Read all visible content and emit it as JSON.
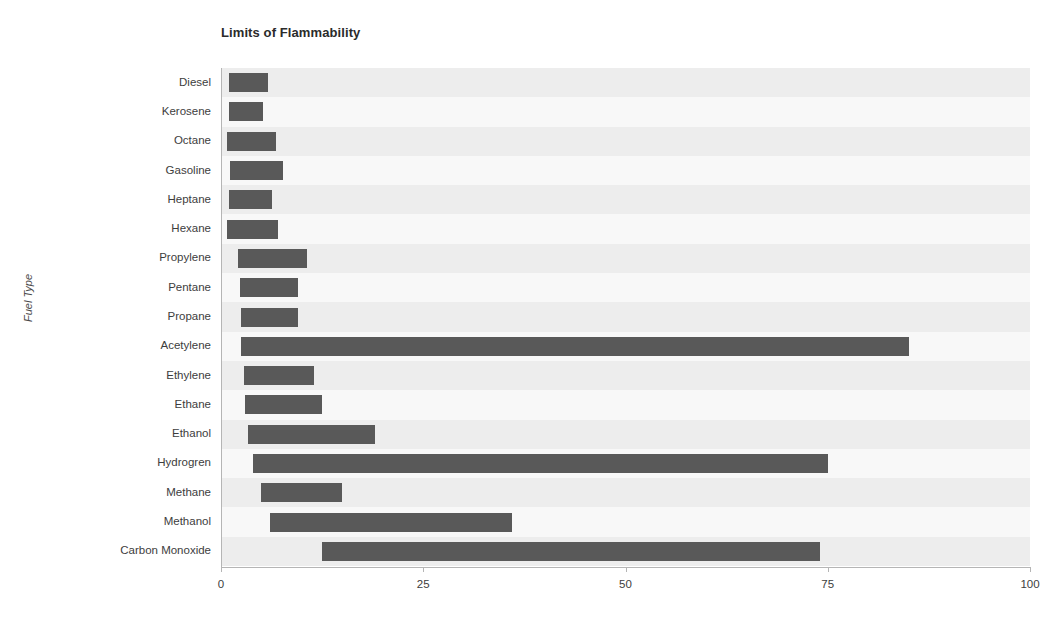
{
  "chart_data": {
    "type": "bar",
    "orientation": "horizontal",
    "subtype": "range-bar",
    "title": "Limits of Flammability",
    "xlabel": "",
    "ylabel": "Fuel Type",
    "xlim": [
      0,
      100
    ],
    "xticks": [
      0,
      25,
      50,
      75,
      100
    ],
    "xtick_labels": [
      "0",
      "25",
      "50",
      "75",
      "100"
    ],
    "grid": false,
    "legend": "none",
    "bar_color": "#595959",
    "band_color": "#ededed",
    "background": "#ffffff",
    "categories": [
      "Diesel",
      "Kerosene",
      "Octane",
      "Gasoline",
      "Heptane",
      "Hexane",
      "Propylene",
      "Pentane",
      "Propane",
      "Acetylene",
      "Ethylene",
      "Ethane",
      "Ethanol",
      "Hydrogren",
      "Methane",
      "Methanol",
      "Carbon Monoxide"
    ],
    "series": [
      {
        "name": "Lower Flammability Limit",
        "values": [
          1.0,
          1.0,
          0.8,
          1.1,
          1.0,
          0.8,
          2.1,
          2.3,
          2.5,
          2.5,
          2.8,
          3.0,
          3.3,
          4.0,
          5.0,
          6.0,
          12.5
        ]
      },
      {
        "name": "Upper Flammability Limit",
        "values": [
          5.8,
          5.2,
          6.8,
          7.7,
          6.3,
          7.0,
          10.6,
          9.5,
          9.5,
          85.0,
          11.5,
          12.5,
          19.0,
          75.0,
          15.0,
          36.0,
          74.0
        ]
      }
    ]
  }
}
